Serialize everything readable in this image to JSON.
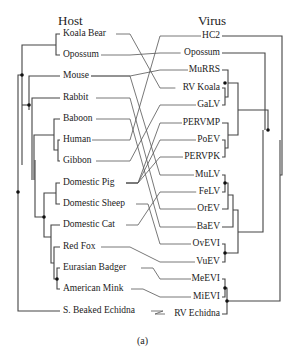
{
  "headers": {
    "host": "Host",
    "virus": "Virus"
  },
  "caption": "(a)",
  "colors": {
    "line": "#444444",
    "tangle": "#555555",
    "node": "#111111"
  },
  "hosts": [
    {
      "label": "Koala Bear",
      "y": 34
    },
    {
      "label": "Opossum",
      "y": 55
    },
    {
      "label": "Mouse",
      "y": 76
    },
    {
      "label": "Rabbit",
      "y": 98
    },
    {
      "label": "Baboon",
      "y": 119
    },
    {
      "label": "Human",
      "y": 140
    },
    {
      "label": "Gibbon",
      "y": 161
    },
    {
      "label": "Domestic Pig",
      "y": 183
    },
    {
      "label": "Domestic Sheep",
      "y": 204
    },
    {
      "label": "Domestic Cat",
      "y": 225
    },
    {
      "label": "Red Fox",
      "y": 247
    },
    {
      "label": "Eurasian Badger",
      "y": 268
    },
    {
      "label": "American Mink",
      "y": 289
    },
    {
      "label": "S. Beaked Echidna",
      "y": 311
    }
  ],
  "viruses": [
    {
      "label": "HC2",
      "y": 36
    },
    {
      "label": "Opossum",
      "y": 53
    },
    {
      "label": "MuRRS",
      "y": 70
    },
    {
      "label": "RV Koala",
      "y": 88
    },
    {
      "label": "GaLV",
      "y": 105
    },
    {
      "label": "PERVMP",
      "y": 123
    },
    {
      "label": "PoEV",
      "y": 140
    },
    {
      "label": "PERVPK",
      "y": 157
    },
    {
      "label": "MuLV",
      "y": 175
    },
    {
      "label": "FeLV",
      "y": 192
    },
    {
      "label": "OrEV",
      "y": 209
    },
    {
      "label": "BaEV",
      "y": 227
    },
    {
      "label": "OvEVI",
      "y": 244
    },
    {
      "label": "VuEV",
      "y": 262
    },
    {
      "label": "MeEVI",
      "y": 279
    },
    {
      "label": "MiEVI",
      "y": 297
    },
    {
      "label": "RV Echidna",
      "y": 314
    }
  ],
  "links": [
    [
      "Koala Bear",
      "RV Koala"
    ],
    [
      "Opossum",
      "Opossum"
    ],
    [
      "Mouse",
      "MuRRS"
    ],
    [
      "Mouse",
      "MuLV"
    ],
    [
      "Rabbit",
      "OrEV"
    ],
    [
      "Baboon",
      "BaEV"
    ],
    [
      "Human",
      "HC2"
    ],
    [
      "Gibbon",
      "GaLV"
    ],
    [
      "Domestic Pig",
      "PERVMP"
    ],
    [
      "Domestic Pig",
      "PoEV"
    ],
    [
      "Domestic Pig",
      "PERVPK"
    ],
    [
      "Domestic Sheep",
      "OvEVI"
    ],
    [
      "Domestic Cat",
      "FeLV"
    ],
    [
      "Red Fox",
      "VuEV"
    ],
    [
      "Eurasian Badger",
      "MeEVI"
    ],
    [
      "American Mink",
      "MiEVI"
    ],
    [
      "S. Beaked Echidna",
      "RV Echidna"
    ]
  ]
}
